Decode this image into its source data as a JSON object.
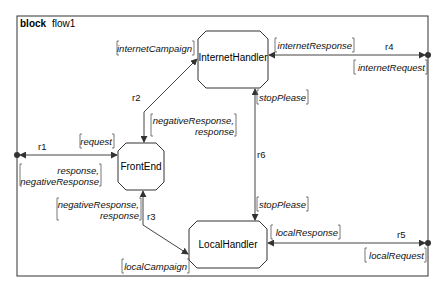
{
  "diagram": {
    "keyword": "block",
    "name": "flow1",
    "nodes": [
      {
        "id": "internet-handler",
        "label": "InternetHandler"
      },
      {
        "id": "front-end",
        "label": "FrontEnd"
      },
      {
        "id": "local-handler",
        "label": "LocalHandler"
      }
    ],
    "connectors": {
      "r1": {
        "label": "r1",
        "in": [
          "request"
        ],
        "out": [
          "response,",
          "negativeResponse"
        ]
      },
      "r2": {
        "label": "r2",
        "top": [
          "internetCampaign"
        ],
        "bottom": [
          "negativeResponse,",
          "response"
        ]
      },
      "r3": {
        "label": "r3",
        "top": [
          "negativeResponse,",
          "response"
        ],
        "bottom": [
          "localCampaign"
        ]
      },
      "r4": {
        "label": "r4",
        "top": [
          "internetResponse"
        ],
        "bottom": [
          "internetRequest"
        ]
      },
      "r5": {
        "label": "r5",
        "top": [
          "localResponse"
        ],
        "bottom": [
          "localRequest"
        ]
      },
      "r6": {
        "label": "r6",
        "top": [
          "stopPlease"
        ],
        "bottom": [
          "stopPlease"
        ]
      }
    }
  }
}
